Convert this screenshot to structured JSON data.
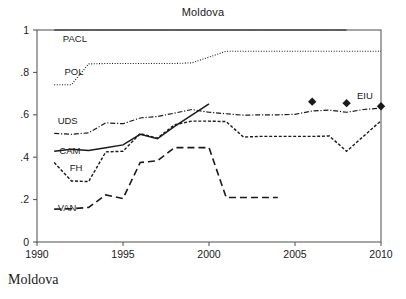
{
  "figure": {
    "title": "Moldova",
    "caption": "Moldova",
    "background_color": "#ffffff",
    "ink_color": "#1a1a1a",
    "frame_color": "#4d4d4d"
  },
  "chart_data": {
    "type": "line",
    "title": "Moldova",
    "xlabel": "",
    "ylabel": "",
    "xlim": [
      1990,
      2010
    ],
    "ylim": [
      0,
      1
    ],
    "grid": false,
    "legend": "inline-labels",
    "xticks": [
      1990,
      1995,
      2000,
      2005,
      2010
    ],
    "xtick_labels": [
      "1990",
      "1995",
      "2000",
      "2005",
      "2010"
    ],
    "yticks": [
      0,
      0.2,
      0.4,
      0.6,
      0.8,
      1
    ],
    "ytick_labels": [
      "0",
      ".2",
      ".4",
      ".6",
      ".8",
      "1"
    ],
    "series": [
      {
        "name": "PACL",
        "label": "PACL",
        "style": "solid-thin",
        "label_x": 1991.5,
        "label_y": 0.945,
        "x": [
          1991,
          1992,
          1993,
          1994,
          1995,
          1996,
          1997,
          1998,
          1999,
          2000,
          2001,
          2002,
          2003,
          2004,
          2005,
          2006,
          2007,
          2008
        ],
        "values": [
          1,
          1,
          1,
          1,
          1,
          1,
          1,
          1,
          1,
          1,
          1,
          1,
          1,
          1,
          1,
          1,
          1,
          1
        ]
      },
      {
        "name": "POL",
        "label": "POL",
        "style": "dotted",
        "label_x": 1991.6,
        "label_y": 0.787,
        "x": [
          1991,
          1992,
          1993,
          1994,
          1995,
          1996,
          1997,
          1998,
          1999,
          2000,
          2001,
          2002,
          2003,
          2004,
          2005,
          2006,
          2007,
          2008,
          2009,
          2010
        ],
        "values": [
          0.742,
          0.742,
          0.84,
          0.842,
          0.842,
          0.842,
          0.842,
          0.842,
          0.845,
          0.872,
          0.9,
          0.9,
          0.9,
          0.9,
          0.9,
          0.9,
          0.9,
          0.9,
          0.9,
          0.9
        ]
      },
      {
        "name": "UDS",
        "label": "UDS",
        "style": "dash-dot",
        "label_x": 1991.2,
        "label_y": 0.558,
        "x": [
          1991,
          1992,
          1993,
          1994,
          1995,
          1996,
          1997,
          1998,
          1999,
          2000,
          2001,
          2002,
          2003,
          2004,
          2005,
          2006,
          2007,
          2008,
          2009,
          2010
        ],
        "values": [
          0.512,
          0.508,
          0.515,
          0.562,
          0.558,
          0.585,
          0.592,
          0.608,
          0.625,
          0.612,
          0.605,
          0.598,
          0.6,
          0.6,
          0.602,
          0.618,
          0.622,
          0.612,
          0.625,
          0.632
        ]
      },
      {
        "name": "CAM",
        "label": "CAM",
        "style": "solid",
        "label_x": 1991.3,
        "label_y": 0.413,
        "x": [
          1991,
          1992,
          1993,
          1994,
          1995,
          1996,
          1997,
          1998,
          1999,
          2000
        ],
        "values": [
          0.428,
          0.438,
          0.432,
          0.445,
          0.458,
          0.508,
          0.487,
          0.545,
          0.598,
          0.652
        ]
      },
      {
        "name": "FH",
        "label": "FH",
        "style": "dashed-short",
        "label_x": 1991.9,
        "label_y": 0.337,
        "x": [
          1991,
          1992,
          1993,
          1994,
          1995,
          1996,
          1997,
          1998,
          1999,
          2000,
          2001,
          2002,
          2003,
          2004,
          2005,
          2006,
          2007,
          2008,
          2009,
          2010
        ],
        "values": [
          0.375,
          0.288,
          0.285,
          0.425,
          0.428,
          0.512,
          0.49,
          0.553,
          0.57,
          0.57,
          0.568,
          0.495,
          0.498,
          0.498,
          0.498,
          0.498,
          0.5,
          0.428,
          0.5,
          0.572
        ]
      },
      {
        "name": "VAN",
        "label": "VAN",
        "style": "dashed-long",
        "label_x": 1991.2,
        "label_y": 0.147,
        "x": [
          1991,
          1992,
          1993,
          1994,
          1995,
          1996,
          1997,
          1998,
          1999,
          2000,
          2001,
          2002,
          2003,
          2004
        ],
        "values": [
          0.155,
          0.157,
          0.163,
          0.222,
          0.205,
          0.375,
          0.383,
          0.445,
          0.445,
          0.445,
          0.21,
          0.21,
          0.21,
          0.21
        ]
      },
      {
        "name": "EIU",
        "label": "EIU",
        "style": "markers-diamond",
        "label_x": 2008.6,
        "label_y": 0.675,
        "x": [
          2006,
          2008,
          2010
        ],
        "values": [
          0.662,
          0.655,
          0.64
        ]
      }
    ]
  }
}
